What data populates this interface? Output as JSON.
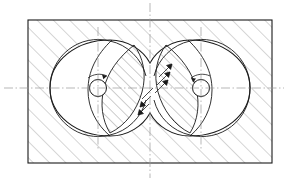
{
  "drawing": {
    "title": "Cross-section of twin-lobe rotor housing",
    "type": "engineering-cross-section",
    "canvas": {
      "width": 288,
      "height": 181,
      "background": "#ffffff"
    },
    "colors": {
      "outline": "#1a1a1a",
      "hatch": "#8a8a8a",
      "centerline": "#9a9a9a",
      "lens_hatch": "#6f6f6f",
      "background": "#ffffff"
    },
    "stroke_widths": {
      "outline": 1.1,
      "inner_outline": 0.9,
      "hatch": 0.7,
      "centerline": 0.7
    },
    "housing_rect": {
      "label": "Sectioned housing block",
      "x": 28,
      "y": 20,
      "width": 244,
      "height": 143,
      "hatch_angle_deg": 45,
      "hatch_spacing": 11.5
    },
    "lobes": [
      {
        "name": "left-lobe",
        "center_x": 98,
        "center_y": 88,
        "radius": 48,
        "bore": {
          "center_x": 98,
          "center_y": 88,
          "radius": 8.5
        },
        "lens_hatch_angle_deg": 45,
        "lens_hatch_spacing": 7.5,
        "rotation_arrow": "clockwise"
      },
      {
        "name": "right-lobe",
        "center_x": 201,
        "center_y": 88,
        "radius": 48,
        "bore": {
          "center_x": 201,
          "center_y": 88,
          "radius": 8.5
        },
        "lens_hatch_angle_deg": 45,
        "lens_hatch_spacing": 7.5,
        "rotation_arrow": "clockwise"
      }
    ],
    "waist": {
      "label": "Concave junction between lobes",
      "top_vertex_x": 150,
      "top_vertex_y": 63,
      "bottom_vertex_x": 150,
      "bottom_vertex_y": 113
    },
    "centerlines": [
      {
        "name": "horizontal-main-centerline",
        "orientation": "horizontal",
        "position": 88,
        "from": 4,
        "to": 284
      },
      {
        "name": "vertical-main-centerline",
        "orientation": "vertical",
        "position": 150,
        "from": 3,
        "to": 178
      },
      {
        "name": "vertical-left-lobe-centerline",
        "orientation": "vertical",
        "position": 98,
        "from": 27,
        "to": 150
      },
      {
        "name": "vertical-right-lobe-centerline",
        "orientation": "vertical",
        "position": 201,
        "from": 27,
        "to": 150
      }
    ],
    "waist_hatch_marks": {
      "label": "Short section hatch strokes in narrow waist",
      "angle_deg": 45,
      "upper_group_count": 3,
      "lower_group_count": 3
    }
  }
}
